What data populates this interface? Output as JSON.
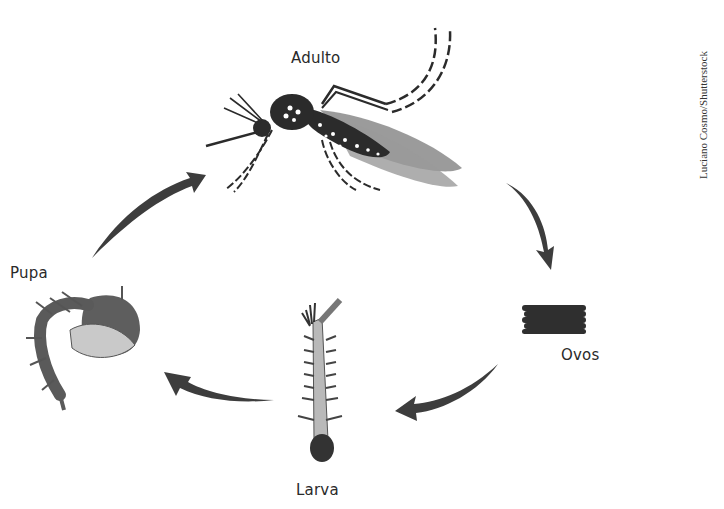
{
  "diagram": {
    "type": "life-cycle",
    "stages": [
      {
        "id": "adulto",
        "label": "Adulto"
      },
      {
        "id": "ovos",
        "label": "Ovos"
      },
      {
        "id": "larva",
        "label": "Larva"
      },
      {
        "id": "pupa",
        "label": "Pupa"
      }
    ],
    "flow": [
      {
        "from": "Adulto",
        "to": "Ovos"
      },
      {
        "from": "Ovos",
        "to": "Larva"
      },
      {
        "from": "Larva",
        "to": "Pupa"
      },
      {
        "from": "Pupa",
        "to": "Adulto"
      }
    ],
    "credit": "Luciano Cosmo/Shutterstock"
  },
  "colors": {
    "arrow": "#3d3d3d",
    "body": "#2b2b2b",
    "wing": "#8a8a8a",
    "label": "#2a2a2a"
  }
}
